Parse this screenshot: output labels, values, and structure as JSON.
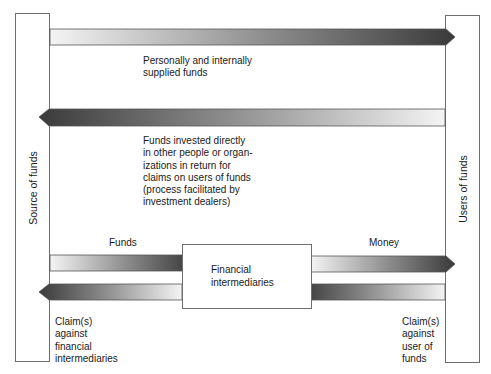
{
  "diagram": {
    "left_column": {
      "label": "Source of funds"
    },
    "right_column": {
      "label": "Users of funds"
    },
    "flows": [
      {
        "id": "personal",
        "direction": "left-to-right",
        "label": "Personally and internally\nsupplied funds"
      },
      {
        "id": "direct",
        "direction": "right-to-left",
        "label": "Funds invested directly\nin other people or organ-\nizations in return for\nclaims on users of funds\n(process facilitated by\ninvestment dealers)"
      },
      {
        "id": "funds",
        "direction": "left-to-right",
        "label": "Funds"
      },
      {
        "id": "claims-fi",
        "direction": "right-to-left",
        "label": "Claim(s)\nagainst\nfinancial\nintermediaries"
      },
      {
        "id": "money",
        "direction": "left-to-right",
        "label": "Money"
      },
      {
        "id": "claims-user",
        "direction": "right-to-left",
        "label": "Claim(s)\nagainst\nuser of\nfunds"
      }
    ],
    "center_box": {
      "label": "Financial\nintermediaries"
    },
    "colors": {
      "arrow_dark": "#3a3a3a",
      "arrow_light": "#f4f4f4",
      "border": "#6e6e6e"
    }
  }
}
